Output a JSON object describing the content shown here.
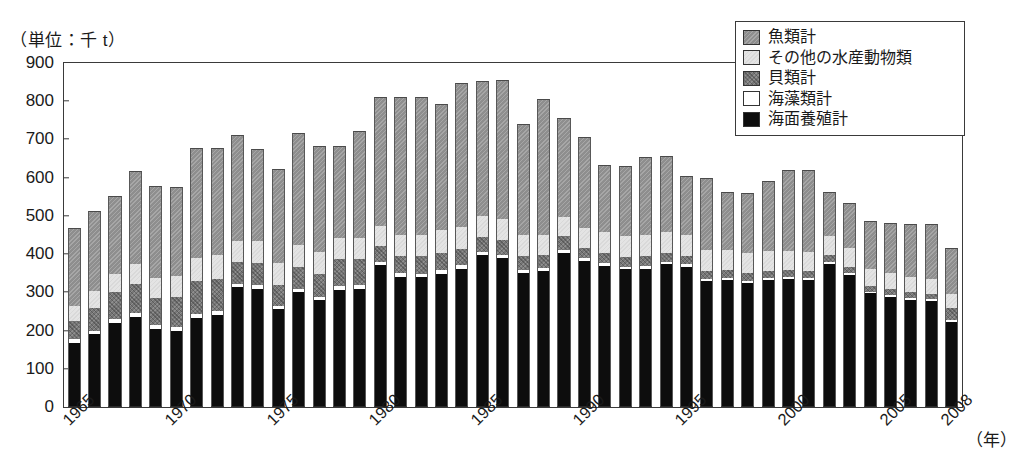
{
  "unit_caption": "（単位：千 t）",
  "x_unit_label": "（年）",
  "legend": {
    "items": [
      {
        "label": "魚類計",
        "key": "fish",
        "color": "#8e8e8e"
      },
      {
        "label": "その他の水産動物類",
        "key": "other",
        "color": "#e4e4e4"
      },
      {
        "label": "貝類計",
        "key": "shell",
        "color": "#767676"
      },
      {
        "label": "海藻類計",
        "key": "algae",
        "color": "#ffffff"
      },
      {
        "label": "海面養殖計",
        "key": "aqua",
        "color": "#0d0d0d"
      }
    ]
  },
  "chart_data": {
    "type": "bar",
    "stacked": true,
    "title": "",
    "subtitle": "",
    "xlabel": "（年）",
    "ylabel": "（単位：千 t）",
    "ylim": [
      0,
      900
    ],
    "ytick_step": 100,
    "yticks": [
      0,
      100,
      200,
      300,
      400,
      500,
      600,
      700,
      800,
      900
    ],
    "grid": false,
    "legend_position": "top-right",
    "xtick_labels": [
      "1965",
      "1970",
      "1975",
      "1980",
      "1985",
      "1990",
      "1995",
      "2000",
      "2005",
      "2008"
    ],
    "xtick_years": [
      1965,
      1970,
      1975,
      1980,
      1985,
      1990,
      1995,
      2000,
      2005,
      2008
    ],
    "categories": [
      1965,
      1966,
      1967,
      1968,
      1969,
      1970,
      1971,
      1972,
      1973,
      1974,
      1975,
      1976,
      1977,
      1978,
      1979,
      1980,
      1981,
      1982,
      1983,
      1984,
      1985,
      1986,
      1987,
      1988,
      1989,
      1990,
      1991,
      1992,
      1993,
      1994,
      1995,
      1996,
      1997,
      1998,
      1999,
      2000,
      2001,
      2002,
      2003,
      2004,
      2005,
      2006,
      2007,
      2008
    ],
    "stack_order_bottom_to_top": [
      "aqua",
      "algae",
      "shell",
      "other",
      "fish"
    ],
    "series": [
      {
        "name": "海面養殖計",
        "key": "aqua",
        "color": "#0d0d0d",
        "values": [
          168,
          191,
          219,
          236,
          203,
          198,
          234,
          241,
          314,
          310,
          256,
          302,
          280,
          307,
          309,
          371,
          341,
          340,
          349,
          362,
          397,
          390,
          350,
          356,
          404,
          382,
          370,
          360,
          362,
          374,
          367,
          329,
          332,
          325,
          333,
          336,
          333,
          375,
          346,
          297,
          288,
          281,
          278,
          223
        ]
      },
      {
        "name": "海藻類計",
        "key": "algae",
        "color": "#ffffff",
        "values": [
          9,
          9,
          10,
          10,
          11,
          11,
          10,
          9,
          9,
          8,
          8,
          8,
          8,
          9,
          9,
          9,
          9,
          9,
          9,
          9,
          8,
          8,
          8,
          8,
          8,
          7,
          7,
          7,
          7,
          6,
          6,
          6,
          6,
          5,
          5,
          5,
          5,
          5,
          5,
          5,
          5,
          5,
          5,
          4
        ]
      },
      {
        "name": "貝類計",
        "key": "shell",
        "color": "#767676",
        "values": [
          48,
          60,
          72,
          77,
          72,
          80,
          85,
          84,
          56,
          59,
          55,
          57,
          60,
          70,
          68,
          42,
          45,
          46,
          46,
          43,
          40,
          39,
          38,
          34,
          36,
          28,
          26,
          25,
          25,
          24,
          23,
          22,
          21,
          20,
          19,
          18,
          18,
          17,
          16,
          15,
          15,
          15,
          14,
          32
        ]
      },
      {
        "name": "その他の水産動物類",
        "key": "other",
        "color": "#e4e4e4",
        "values": [
          40,
          44,
          48,
          50,
          52,
          55,
          60,
          63,
          55,
          58,
          58,
          58,
          57,
          55,
          55,
          52,
          55,
          55,
          58,
          56,
          54,
          54,
          54,
          52,
          50,
          52,
          55,
          55,
          56,
          55,
          55,
          54,
          53,
          52,
          50,
          50,
          50,
          50,
          48,
          44,
          42,
          40,
          38,
          38
        ]
      },
      {
        "name": "魚類計",
        "key": "fish",
        "color": "#8e8e8e",
        "values": [
          203,
          208,
          204,
          244,
          239,
          231,
          288,
          280,
          279,
          239,
          247,
          293,
          278,
          242,
          280,
          336,
          360,
          360,
          330,
          379,
          354,
          364,
          290,
          355,
          258,
          238,
          175,
          183,
          205,
          197,
          154,
          188,
          150,
          158,
          184,
          211,
          214,
          115,
          118,
          125,
          132,
          138,
          144,
          120
        ]
      }
    ],
    "totals": [
      468,
      512,
      553,
      617,
      577,
      575,
      677,
      677,
      713,
      674,
      624,
      718,
      683,
      683,
      721,
      810,
      810,
      810,
      792,
      849,
      853,
      855,
      740,
      805,
      756,
      707,
      633,
      630,
      655,
      656,
      605,
      599,
      562,
      560,
      591,
      620,
      620,
      562,
      533,
      486,
      482,
      479,
      479,
      417
    ]
  }
}
